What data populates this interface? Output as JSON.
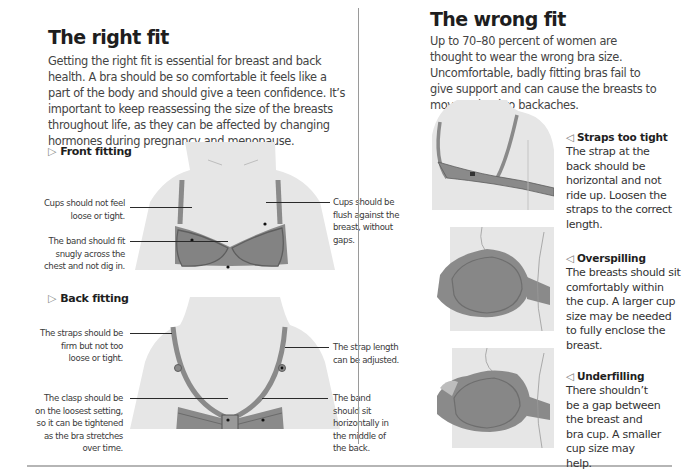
{
  "right_fit": {
    "title": "The right fit",
    "intro": "Getting the right fit is essential for breast and back health. A bra should be so comfortable it feels like a part of the body and should give a teen confidence. It’s important to keep reassessing the size of the breasts throughout life, as they can be affected by changing hormones during pregnancy and menopause.",
    "front": {
      "heading_icon": "▷",
      "heading": "Front fitting",
      "captions": {
        "cups_left": "Cups should not feel loose or tight.",
        "band": "The band should fit snugly across the chest and not dig in.",
        "cups_right": "Cups should be flush against the breast, without gaps."
      }
    },
    "back": {
      "heading_icon": "▷",
      "heading": "Back fitting",
      "captions": {
        "straps": "The straps should be firm but not too loose or tight.",
        "clasp": "The clasp should be on the loosest setting, so it can be tightened as the bra stretches over time.",
        "strap_length": "The strap length can be adjusted.",
        "band": "The band should sit horizontally in the middle of the back."
      }
    }
  },
  "wrong_fit": {
    "title": "The wrong fit",
    "intro": "Up to 70–80 percent of women are thought to wear the wrong bra size. Uncomfortable, badly fitting bras fail to give support and can cause the breasts to move or lead to backaches.",
    "items": [
      {
        "icon": "◁",
        "title": "Straps too tight",
        "body": "The strap at the back should be horizontal and not ride up. Loosen the straps to the correct length."
      },
      {
        "icon": "◁",
        "title": "Overspilling",
        "body": "The breasts should sit comfortably within the cup. A larger cup size may be needed to fully enclose the breast."
      },
      {
        "icon": "◁",
        "title": "Underfilling",
        "body": "There shouldn’t be a gap between the breast and bra cup. A smaller cup size may help."
      }
    ]
  },
  "colors": {
    "skin": "#e6e6e6",
    "bra_fill": "#8a8a8a",
    "bra_edge": "#6f6f6f",
    "text": "#3a3a3a",
    "heading": "#1e1e1e"
  }
}
